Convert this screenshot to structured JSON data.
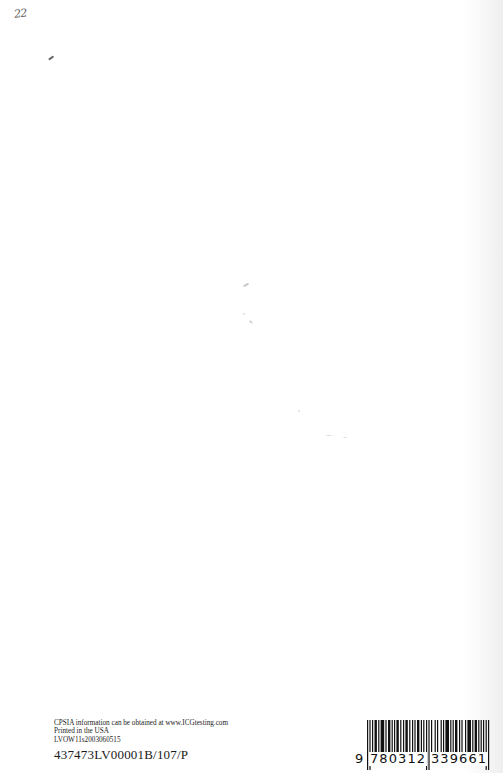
{
  "page": {
    "handwritten_page_number": "22"
  },
  "imprint": {
    "cpsia_line": "CPSIA information can be obtained at www.ICGtesting.com",
    "printed_line": "Printed in the USA",
    "print_code": "LVOW11s2003060515",
    "lot_code": "437473LV00001B/107/P"
  },
  "barcode": {
    "type": "EAN-13",
    "number": "9780312339661",
    "digit_first": "9",
    "digits_left": "780312",
    "digits_right": "339661",
    "bar_color": "#111111"
  }
}
